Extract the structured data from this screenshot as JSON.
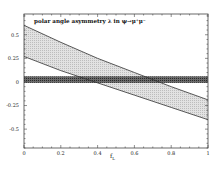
{
  "chart_data": {
    "type": "area",
    "title": "polar angle asymmetry λ in ψ→μ⁺μ⁻",
    "xlabel": "f_L",
    "ylabel": "",
    "xlim": [
      0,
      1
    ],
    "ylim": [
      -0.7,
      0.72
    ],
    "xticks": [
      0,
      0.2,
      0.4,
      0.6,
      0.8,
      1
    ],
    "xtick_labels": [
      "0",
      "0.2",
      "0.4",
      "0.6",
      "0.8",
      "1"
    ],
    "yticks": [
      0.5,
      0.25,
      0,
      -0.25,
      -0.5
    ],
    "ytick_labels": [
      "0.5",
      "0.25",
      "0",
      "-0.25",
      "-0.5"
    ],
    "grid": false,
    "legend": null,
    "series": [
      {
        "name": "prediction band",
        "kind": "band",
        "fill": "#d9d9d9",
        "x": [
          0,
          0.2,
          0.4,
          0.6,
          0.8,
          1.0
        ],
        "upper": [
          0.6,
          0.42,
          0.25,
          0.1,
          -0.05,
          -0.19
        ],
        "lower": [
          0.27,
          0.12,
          -0.01,
          -0.14,
          -0.27,
          -0.4
        ]
      },
      {
        "name": "measurement band",
        "kind": "horizontal-band",
        "fill": "#555555",
        "x": [
          0,
          1
        ],
        "upper": [
          0.06,
          0.06
        ],
        "lower": [
          -0.01,
          -0.01
        ]
      }
    ]
  },
  "labels": {
    "title": "polar angle asymmetry λ in ψ→μ⁺μ⁻",
    "xlabel_main": "f",
    "xlabel_sub": "L",
    "xticks": [
      "0",
      "0.2",
      "0.4",
      "0.6",
      "0.8",
      "1"
    ],
    "yticks": [
      "0.5",
      "0.25",
      "0",
      "-0.25",
      "-0.5"
    ]
  }
}
